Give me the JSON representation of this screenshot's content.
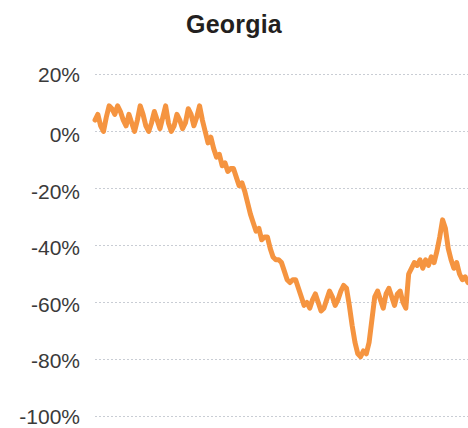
{
  "chart_data": {
    "type": "line",
    "title": "Georgia",
    "xlabel": "",
    "ylabel": "",
    "ylim": [
      -100,
      20
    ],
    "yticks": [
      20,
      0,
      -20,
      -40,
      -60,
      -80,
      -100
    ],
    "ytick_labels": [
      "20%",
      "0%",
      "-20%",
      "-40%",
      "-60%",
      "-80%",
      "-100%"
    ],
    "grid": true,
    "grid_style": "dotted",
    "grid_color": "#c9cdd4",
    "legend": "none",
    "line_color": "#f59440",
    "line_width": 5,
    "x_axis_visible": false,
    "x": [
      0,
      1,
      2,
      3,
      4,
      5,
      6,
      7,
      8,
      9,
      10,
      11,
      12,
      13,
      14,
      15,
      16,
      17,
      18,
      19,
      20,
      21,
      22,
      23,
      24,
      25,
      26,
      27,
      28,
      29,
      30,
      31,
      32,
      33,
      34,
      35,
      36,
      37,
      38,
      39,
      40,
      41,
      42,
      43,
      44,
      45,
      46,
      47,
      48,
      49,
      50,
      51,
      52,
      53,
      54,
      55,
      56,
      57,
      58,
      59,
      60,
      61,
      62,
      63,
      64,
      65,
      66,
      67,
      68,
      69,
      70,
      71,
      72,
      73,
      74,
      75,
      76,
      77,
      78,
      79,
      80,
      81,
      82,
      83,
      84,
      85,
      86,
      87,
      88,
      89,
      90,
      91,
      92,
      93,
      94,
      95,
      96,
      97,
      98,
      99,
      100,
      101,
      102,
      103,
      104,
      105,
      106,
      107,
      108,
      109,
      110,
      111,
      112,
      113,
      114,
      115,
      116,
      117,
      118,
      119,
      120,
      121,
      122,
      123,
      124,
      125
    ],
    "values": [
      4,
      6,
      2,
      0,
      5,
      9,
      8,
      6,
      9,
      7,
      4,
      2,
      6,
      3,
      0,
      4,
      9,
      6,
      2,
      0,
      3,
      7,
      4,
      1,
      5,
      9,
      3,
      0,
      2,
      6,
      4,
      1,
      3,
      8,
      6,
      2,
      5,
      9,
      4,
      0,
      -4,
      -2,
      -6,
      -9,
      -8,
      -12,
      -11,
      -14,
      -13,
      -13,
      -16,
      -19,
      -18,
      -21,
      -25,
      -29,
      -32,
      -35,
      -34,
      -38,
      -37,
      -37,
      -41,
      -44,
      -45,
      -45,
      -46,
      -49,
      -52,
      -53,
      -52,
      -52,
      -55,
      -58,
      -61,
      -60,
      -62,
      -59,
      -57,
      -60,
      -63,
      -62,
      -59,
      -56,
      -58,
      -61,
      -59,
      -56,
      -54,
      -55,
      -61,
      -68,
      -74,
      -78,
      -79,
      -77,
      -78,
      -74,
      -66,
      -58,
      -56,
      -59,
      -62,
      -57,
      -55,
      -58,
      -61,
      -57,
      -56,
      -60,
      -62,
      -50,
      -48,
      -46,
      -47,
      -45,
      -48,
      -45,
      -47,
      -44,
      -46,
      -42,
      -37,
      -31,
      -34,
      -41
    ],
    "values_tail": [
      -45,
      -48,
      -46,
      -50,
      -52,
      -51,
      -53
    ],
    "annotations": []
  }
}
